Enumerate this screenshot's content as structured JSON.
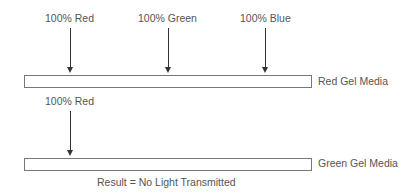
{
  "diagram": {
    "top_section": {
      "sources": [
        {
          "label": "100% Red"
        },
        {
          "label": "100% Green"
        },
        {
          "label": "100% Blue"
        }
      ],
      "media_label": "Red Gel Media"
    },
    "bottom_section": {
      "sources": [
        {
          "label": "100% Red"
        }
      ],
      "media_label": "Green Gel Media",
      "result_label": "Result = No Light Transmitted"
    }
  }
}
